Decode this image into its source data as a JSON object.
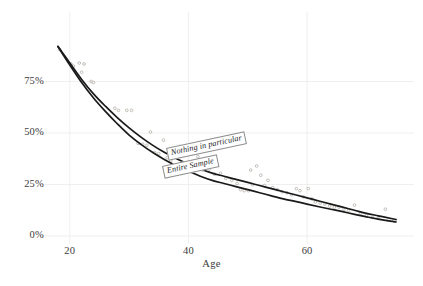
{
  "chart_data": {
    "type": "line",
    "title": "",
    "subtitle": "",
    "xlabel": "Age",
    "ylabel": "",
    "xlim": [
      17,
      76
    ],
    "ylim": [
      0,
      100
    ],
    "grid": true,
    "grid_color": "#ebebeb",
    "legend_position": "inline-curve-labels",
    "background": "#ffffff",
    "line_color": "#1a1a1a",
    "point_color": "#b9b4ad",
    "xticks": [
      20,
      40,
      60
    ],
    "xtick_labels": [
      "20",
      "40",
      "60"
    ],
    "yticks": [
      0,
      25,
      50,
      75
    ],
    "ytick_labels": [
      "0%",
      "25%",
      "50%",
      "75%"
    ],
    "series": [
      {
        "name": "Nothing in particular",
        "x": [
          18,
          20,
          22,
          24,
          26,
          28,
          30,
          32,
          34,
          36,
          38,
          40,
          42,
          44,
          46,
          48,
          50,
          52,
          54,
          56,
          58,
          60,
          62,
          64,
          66,
          68,
          70,
          72,
          74,
          75
        ],
        "values": [
          92,
          84,
          76,
          69,
          63,
          57.5,
          52.5,
          48,
          44,
          40.5,
          37.5,
          35,
          32.5,
          30.5,
          29,
          27.5,
          26,
          24.5,
          23,
          21.5,
          20,
          18.5,
          17,
          15.5,
          14,
          12.5,
          11,
          9.8,
          8.6,
          8.0
        ]
      },
      {
        "name": "Entire Sample",
        "x": [
          18,
          20,
          22,
          24,
          26,
          28,
          30,
          32,
          34,
          36,
          38,
          40,
          42,
          44,
          46,
          48,
          50,
          52,
          54,
          56,
          58,
          60,
          62,
          64,
          66,
          68,
          70,
          72,
          74,
          75
        ],
        "values": [
          92,
          83,
          74.5,
          67,
          60.5,
          54.5,
          49,
          44.5,
          40.5,
          37,
          34,
          31.5,
          29,
          27,
          25.5,
          24,
          22.5,
          21,
          19.5,
          18,
          16.8,
          15.5,
          14.2,
          13,
          11.8,
          10.5,
          9.3,
          8.2,
          7.2,
          6.8
        ]
      }
    ],
    "scatter": [
      {
        "x": 18.3,
        "y": 90.5
      },
      {
        "x": 20.2,
        "y": 83.5
      },
      {
        "x": 20.6,
        "y": 82.5
      },
      {
        "x": 21.6,
        "y": 84.0
      },
      {
        "x": 22.4,
        "y": 83.5
      },
      {
        "x": 22.0,
        "y": 79.5
      },
      {
        "x": 23.6,
        "y": 75.0
      },
      {
        "x": 24.0,
        "y": 74.5
      },
      {
        "x": 27.6,
        "y": 62.0
      },
      {
        "x": 28.2,
        "y": 61.0
      },
      {
        "x": 29.6,
        "y": 61.0
      },
      {
        "x": 30.4,
        "y": 61.0
      },
      {
        "x": 31.5,
        "y": 45.0
      },
      {
        "x": 32.3,
        "y": 44.5
      },
      {
        "x": 33.0,
        "y": 44.0
      },
      {
        "x": 33.6,
        "y": 50.5
      },
      {
        "x": 34.3,
        "y": 40.5
      },
      {
        "x": 35.0,
        "y": 40.0
      },
      {
        "x": 35.8,
        "y": 46.5
      },
      {
        "x": 36.4,
        "y": 38.0
      },
      {
        "x": 37.0,
        "y": 36.5
      },
      {
        "x": 38.6,
        "y": 43.5
      },
      {
        "x": 39.5,
        "y": 35.5
      },
      {
        "x": 40.4,
        "y": 34.5
      },
      {
        "x": 41.6,
        "y": 38.5
      },
      {
        "x": 42.4,
        "y": 32.0
      },
      {
        "x": 43.5,
        "y": 32.5
      },
      {
        "x": 44.4,
        "y": 30.0
      },
      {
        "x": 45.4,
        "y": 30.5
      },
      {
        "x": 46.3,
        "y": 28.0
      },
      {
        "x": 47.3,
        "y": 27.0
      },
      {
        "x": 48.2,
        "y": 25.5
      },
      {
        "x": 48.8,
        "y": 22.5
      },
      {
        "x": 49.4,
        "y": 22.0
      },
      {
        "x": 50.1,
        "y": 22.0
      },
      {
        "x": 50.8,
        "y": 25.0
      },
      {
        "x": 50.5,
        "y": 32.0
      },
      {
        "x": 51.5,
        "y": 34.0
      },
      {
        "x": 52.2,
        "y": 29.5
      },
      {
        "x": 52.8,
        "y": 24.5
      },
      {
        "x": 53.4,
        "y": 27.0
      },
      {
        "x": 54.2,
        "y": 23.5
      },
      {
        "x": 55.0,
        "y": 22.5
      },
      {
        "x": 55.8,
        "y": 21.5
      },
      {
        "x": 56.6,
        "y": 21.0
      },
      {
        "x": 57.4,
        "y": 20.0
      },
      {
        "x": 58.2,
        "y": 23.0
      },
      {
        "x": 58.8,
        "y": 22.0
      },
      {
        "x": 59.4,
        "y": 19.0
      },
      {
        "x": 60.2,
        "y": 23.0
      },
      {
        "x": 60.8,
        "y": 18.0
      },
      {
        "x": 61.4,
        "y": 16.5
      },
      {
        "x": 62.2,
        "y": 16.0
      },
      {
        "x": 63.0,
        "y": 15.5
      },
      {
        "x": 63.8,
        "y": 14.5
      },
      {
        "x": 64.6,
        "y": 14.0
      },
      {
        "x": 65.4,
        "y": 14.0
      },
      {
        "x": 66.2,
        "y": 13.0
      },
      {
        "x": 67.0,
        "y": 12.5
      },
      {
        "x": 68.0,
        "y": 15.0
      },
      {
        "x": 69.0,
        "y": 11.0
      },
      {
        "x": 70.0,
        "y": 10.0
      },
      {
        "x": 71.0,
        "y": 9.0
      },
      {
        "x": 72.0,
        "y": 8.5
      },
      {
        "x": 73.2,
        "y": 13.0
      },
      {
        "x": 73.8,
        "y": 8.0
      },
      {
        "x": 74.6,
        "y": 7.5
      }
    ],
    "annotations": [
      {
        "name": "Nothing in particular",
        "text": "Nothing in particular"
      },
      {
        "name": "Entire Sample",
        "text": "Entire Sample"
      }
    ]
  },
  "axis": {
    "x_title": "Age",
    "x_ticks": [
      "20",
      "40",
      "60"
    ],
    "y_ticks": [
      "75%",
      "50%",
      "25%",
      "0%"
    ]
  },
  "labels": {
    "nothing_in_particular": "Nothing in particular",
    "entire_sample": "Entire Sample"
  },
  "caption": {
    "text": ""
  }
}
